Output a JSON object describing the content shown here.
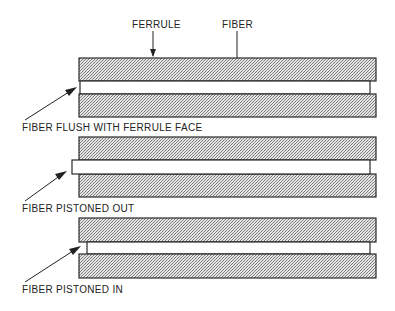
{
  "labels": {
    "ferrule": "FERRULE",
    "fiber": "FIBER",
    "flush": "FIBER FLUSH WITH FERRULE FACE",
    "pistoned_out": "FIBER PISTONED OUT",
    "pistoned_in": "FIBER PISTONED IN"
  },
  "colors": {
    "stroke": "#2a2a2a",
    "stipple_dark": "#8c8c8c",
    "stipple_light": "#e6e6e6",
    "background": "#ffffff"
  },
  "diagrams": [
    {
      "name": "fiber-flush",
      "fiber_offset": "flush"
    },
    {
      "name": "fiber-pistoned-out",
      "fiber_offset": "protruding"
    },
    {
      "name": "fiber-pistoned-in",
      "fiber_offset": "recessed"
    }
  ]
}
